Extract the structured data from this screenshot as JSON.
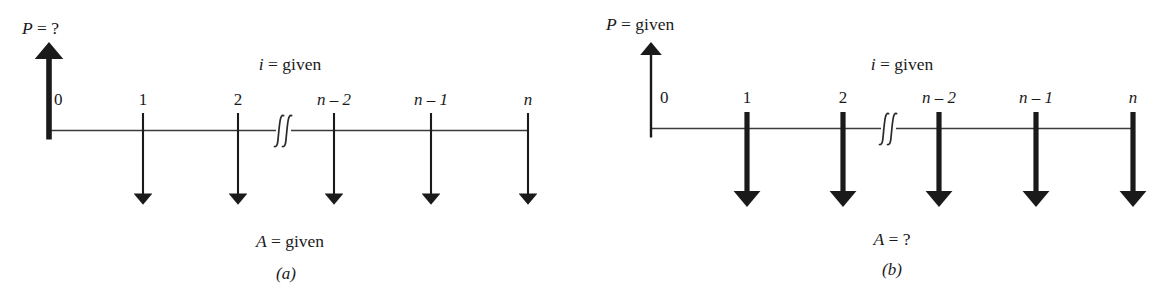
{
  "figure": {
    "background_color": "#ffffff",
    "ink_color": "#1a1a1a"
  },
  "panels": [
    {
      "id": "a",
      "caption": "(a)",
      "top_left_label": {
        "symbol": "P",
        "equals": "=",
        "value": "?",
        "text": "P = ?"
      },
      "interest_label": {
        "symbol": "i",
        "equals": "=",
        "value": "given",
        "text": "i = given"
      },
      "series_label": {
        "symbol": "A",
        "equals": "=",
        "value": "given",
        "text": "A = given"
      },
      "timeline_ticks": [
        "0",
        "1",
        "2",
        "n – 2",
        "n – 1",
        "n"
      ],
      "up_arrow_weight": "thick",
      "down_arrow_weight": "thin",
      "break_symbol": "∫∫"
    },
    {
      "id": "b",
      "caption": "(b)",
      "top_left_label": {
        "symbol": "P",
        "equals": "=",
        "value": "given",
        "text": "P = given"
      },
      "interest_label": {
        "symbol": "i",
        "equals": "=",
        "value": "given",
        "text": "i = given"
      },
      "series_label": {
        "symbol": "A",
        "equals": "=",
        "value": "?",
        "text": "A = ?"
      },
      "timeline_ticks": [
        "0",
        "1",
        "2",
        "n – 2",
        "n – 1",
        "n"
      ],
      "up_arrow_weight": "thin",
      "down_arrow_weight": "thick",
      "break_symbol": "∫∫"
    }
  ],
  "tick_marks": {
    "panel_a": {
      "zero": "0",
      "one": "1",
      "two": "2",
      "n_minus_2": "n – 2",
      "n_minus_1": "n – 1",
      "n": "n"
    },
    "panel_b": {
      "zero": "0",
      "one": "1",
      "two": "2",
      "n_minus_2": "n – 2",
      "n_minus_1": "n – 1",
      "n": "n"
    }
  }
}
